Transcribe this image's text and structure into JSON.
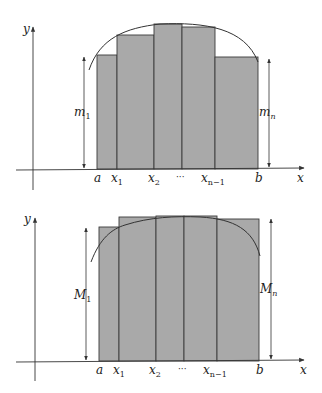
{
  "colors": {
    "bar_fill": "#a9a9a9",
    "bar_stroke": "#3a3a3a",
    "axis": "#333333",
    "curve": "#333333"
  },
  "diagrams": [
    {
      "title": "lower-sum",
      "axis_labels": {
        "x": "x",
        "y": "y"
      },
      "tick_labels": [
        {
          "main": "a",
          "sub": ""
        },
        {
          "main": "x",
          "sub": "1"
        },
        {
          "main": "x",
          "sub": "2"
        },
        {
          "main": "···",
          "sub": ""
        },
        {
          "main": "x",
          "sub": "n−1"
        },
        {
          "main": "b",
          "sub": ""
        }
      ],
      "left_height_label": {
        "main": "m",
        "sub": "1"
      },
      "right_height_label": {
        "main": "m",
        "sub": "n"
      }
    },
    {
      "title": "upper-sum",
      "axis_labels": {
        "x": "x",
        "y": "y"
      },
      "tick_labels": [
        {
          "main": "a",
          "sub": ""
        },
        {
          "main": "x",
          "sub": "1"
        },
        {
          "main": "x",
          "sub": "2"
        },
        {
          "main": "···",
          "sub": ""
        },
        {
          "main": "x",
          "sub": "n−1"
        },
        {
          "main": "b",
          "sub": ""
        }
      ],
      "left_height_label": {
        "main": "M",
        "sub": "1"
      },
      "right_height_label": {
        "main": "M",
        "sub": "n"
      }
    }
  ]
}
